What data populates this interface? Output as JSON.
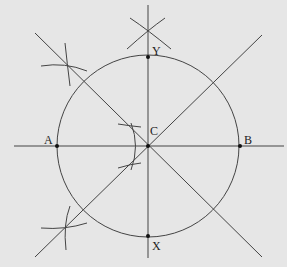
{
  "diagram": {
    "colors": {
      "background": "#e6e6e6",
      "stroke": "#444444",
      "point": "#111111",
      "label": "#222222"
    },
    "points": [
      {
        "id": "A",
        "label": "A",
        "x": 57,
        "y": 146
      },
      {
        "id": "B",
        "label": "B",
        "x": 240,
        "y": 146
      },
      {
        "id": "C",
        "label": "C",
        "x": 148,
        "y": 146
      },
      {
        "id": "Y",
        "label": "Y",
        "x": 148,
        "y": 57
      },
      {
        "id": "X",
        "label": "X",
        "x": 148,
        "y": 236
      }
    ],
    "circle": {
      "cx": 148,
      "cy": 146,
      "r": 91
    }
  }
}
